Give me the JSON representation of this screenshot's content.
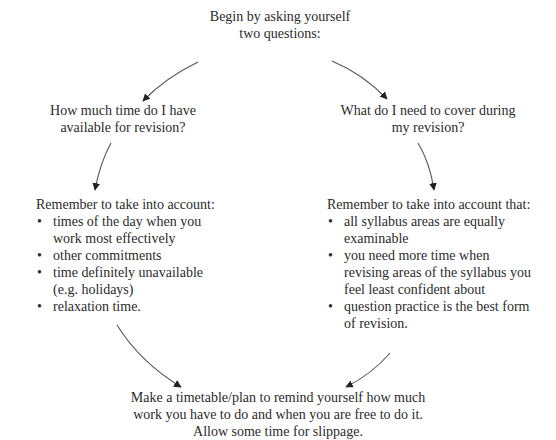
{
  "diagram": {
    "type": "flow-cycle",
    "start": {
      "lines": [
        "Begin by asking yourself",
        "two questions:"
      ]
    },
    "question_left": {
      "lines": [
        "How much time do I have",
        "available for revision?"
      ]
    },
    "question_right": {
      "lines": [
        "What do I need to cover during",
        "my revision?"
      ]
    },
    "left_list": {
      "heading": "Remember to take into account:",
      "bullet": "•",
      "items": [
        {
          "lines": [
            "times of the day when you",
            "work most effectively"
          ]
        },
        {
          "lines": [
            "other commitments"
          ]
        },
        {
          "lines": [
            "time definitely unavailable",
            "(e.g. holidays)"
          ]
        },
        {
          "lines": [
            "relaxation time."
          ]
        }
      ]
    },
    "right_list": {
      "heading": "Remember to take into account that:",
      "bullet": "•",
      "items": [
        {
          "lines": [
            "all syllabus areas are equally",
            "examinable"
          ]
        },
        {
          "lines": [
            "you need more time when",
            "revising areas of the syllabus you",
            "feel least confident about"
          ]
        },
        {
          "lines": [
            "question practice is the best form",
            "of revision."
          ]
        }
      ]
    },
    "conclusion": {
      "lines": [
        "Make a timetable/plan to remind yourself how much",
        "work you have to do and when you are free to do it.",
        "Allow some time for slippage."
      ]
    },
    "colors": {
      "text": "#2b2b2b",
      "arrow": "#555555",
      "arrowhead": "#222222",
      "background": "#ffffff"
    }
  }
}
